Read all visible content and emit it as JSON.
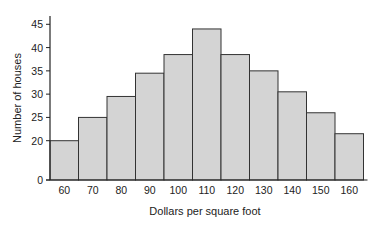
{
  "chart_data": {
    "type": "bar",
    "subtype": "histogram",
    "title": "",
    "xlabel": "Dollars per square foot",
    "ylabel": "Number of houses",
    "categories": [
      "60",
      "70",
      "80",
      "90",
      "100",
      "110",
      "120",
      "130",
      "140",
      "150",
      "160"
    ],
    "values": [
      20,
      25,
      29.5,
      34.5,
      38.5,
      44,
      38.5,
      35,
      30.5,
      26,
      21.5
    ],
    "yticks": [
      0,
      20,
      25,
      30,
      35,
      40,
      45
    ],
    "ylim": [
      0,
      46
    ],
    "y_axis_break": "between 0 and 20",
    "grid": false,
    "legend": null,
    "bar_color": "#d4d4d4",
    "bar_edge_color": "#333333"
  }
}
